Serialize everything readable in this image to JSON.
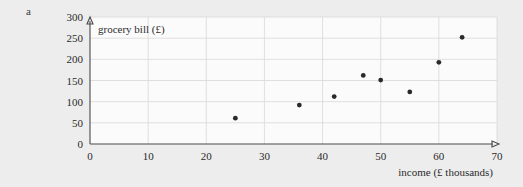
{
  "figure": {
    "part_label": "a",
    "background_color": "#ededed",
    "plot_background_color": "#fbfbfb",
    "gridline_color": "#d8d8d8",
    "axis_color": "#4a4a4a",
    "marker_color": "#2a2a2a"
  },
  "chart_data": {
    "type": "scatter",
    "title": "",
    "xlabel": "income (£ thousands)",
    "ylabel": "grocery bill (£)",
    "xlim": [
      0,
      70
    ],
    "ylim": [
      0,
      300
    ],
    "xticks": [
      0,
      10,
      20,
      30,
      40,
      50,
      60,
      70
    ],
    "yticks": [
      0,
      50,
      100,
      150,
      200,
      250,
      300
    ],
    "xtick_labels": [
      "0",
      "10",
      "20",
      "30",
      "40",
      "50",
      "60",
      "70"
    ],
    "ytick_labels": [
      "0",
      "50",
      "100",
      "150",
      "200",
      "250",
      "300"
    ],
    "grid": true,
    "legend": null,
    "x": [
      25,
      36,
      42,
      47,
      50,
      55,
      60,
      64
    ],
    "y": [
      61,
      92,
      112,
      162,
      151,
      123,
      193,
      252
    ],
    "points": [
      {
        "x": 25,
        "y": 61
      },
      {
        "x": 36,
        "y": 92
      },
      {
        "x": 42,
        "y": 112
      },
      {
        "x": 47,
        "y": 162
      },
      {
        "x": 50,
        "y": 151
      },
      {
        "x": 55,
        "y": 123
      },
      {
        "x": 60,
        "y": 193
      },
      {
        "x": 64,
        "y": 252
      }
    ]
  }
}
